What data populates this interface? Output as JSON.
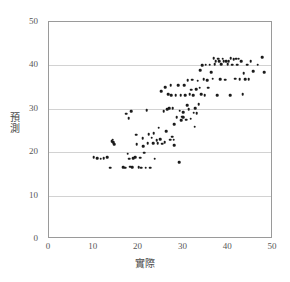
{
  "chart_data": {
    "type": "scatter",
    "title": "",
    "xlabel": "實際",
    "ylabel": "預測",
    "xlim": [
      0,
      50
    ],
    "ylim": [
      0,
      50
    ],
    "xticks": [
      0,
      10,
      20,
      30,
      40,
      50
    ],
    "yticks": [
      0,
      10,
      20,
      30,
      40,
      50
    ],
    "gridlines": {
      "horizontal": [
        10,
        20,
        30,
        40
      ],
      "vertical": []
    },
    "legend": null,
    "marker": {
      "shape": "circle",
      "color": "#1b1b1b",
      "size": 2.6
    },
    "series": [
      {
        "name": "預測 vs 實際",
        "points": [
          [
            10.0,
            18.9
          ],
          [
            10.8,
            18.6
          ],
          [
            11.5,
            18.5
          ],
          [
            12.2,
            18.6
          ],
          [
            13.0,
            18.9
          ],
          [
            13.6,
            16.4
          ],
          [
            14.0,
            22.6
          ],
          [
            14.2,
            22.9
          ],
          [
            14.3,
            22.3
          ],
          [
            14.6,
            21.9
          ],
          [
            16.6,
            16.5
          ],
          [
            17.0,
            16.4
          ],
          [
            17.2,
            28.9
          ],
          [
            17.6,
            19.7
          ],
          [
            17.8,
            27.8
          ],
          [
            17.9,
            18.5
          ],
          [
            18.1,
            16.7
          ],
          [
            18.3,
            29.5
          ],
          [
            18.6,
            16.5
          ],
          [
            18.8,
            18.6
          ],
          [
            19.2,
            18.8
          ],
          [
            19.5,
            24.0
          ],
          [
            19.6,
            21.9
          ],
          [
            20.0,
            16.5
          ],
          [
            20.4,
            18.7
          ],
          [
            20.6,
            16.4
          ],
          [
            20.9,
            23.2
          ],
          [
            21.0,
            21.4
          ],
          [
            21.3,
            19.9
          ],
          [
            21.6,
            16.4
          ],
          [
            21.8,
            29.7
          ],
          [
            22.0,
            22.1
          ],
          [
            22.3,
            24.2
          ],
          [
            22.6,
            16.4
          ],
          [
            22.9,
            23.3
          ],
          [
            23.2,
            22.1
          ],
          [
            23.4,
            24.4
          ],
          [
            23.6,
            18.5
          ],
          [
            24.0,
            22.8
          ],
          [
            24.3,
            22.1
          ],
          [
            24.5,
            25.6
          ],
          [
            24.8,
            23.0
          ],
          [
            25.0,
            34.1
          ],
          [
            25.3,
            22.0
          ],
          [
            25.6,
            29.4
          ],
          [
            25.8,
            22.3
          ],
          [
            26.0,
            35.0
          ],
          [
            26.2,
            24.9
          ],
          [
            26.4,
            29.9
          ],
          [
            26.6,
            33.3
          ],
          [
            26.8,
            30.1
          ],
          [
            27.0,
            22.9
          ],
          [
            27.2,
            35.4
          ],
          [
            27.3,
            33.2
          ],
          [
            27.5,
            23.6
          ],
          [
            27.6,
            30.2
          ],
          [
            27.8,
            22.9
          ],
          [
            27.9,
            21.6
          ],
          [
            28.0,
            26.5
          ],
          [
            28.3,
            33.2
          ],
          [
            28.5,
            28.0
          ],
          [
            28.8,
            35.4
          ],
          [
            29.0,
            17.7
          ],
          [
            29.2,
            29.6
          ],
          [
            29.4,
            33.2
          ],
          [
            29.5,
            27.4
          ],
          [
            29.7,
            28.2
          ],
          [
            29.9,
            29.2
          ],
          [
            30.0,
            28.0
          ],
          [
            30.2,
            35.5
          ],
          [
            30.4,
            33.2
          ],
          [
            30.6,
            27.5
          ],
          [
            30.8,
            30.8
          ],
          [
            31.0,
            36.6
          ],
          [
            31.2,
            29.9
          ],
          [
            31.4,
            33.3
          ],
          [
            31.6,
            27.7
          ],
          [
            31.8,
            34.4
          ],
          [
            32.0,
            36.7
          ],
          [
            32.2,
            33.2
          ],
          [
            32.3,
            29.1
          ],
          [
            32.5,
            25.9
          ],
          [
            32.7,
            30.2
          ],
          [
            32.9,
            34.5
          ],
          [
            33.0,
            29.0
          ],
          [
            33.2,
            36.5
          ],
          [
            33.4,
            31.1
          ],
          [
            33.6,
            34.9
          ],
          [
            33.8,
            38.9
          ],
          [
            34.0,
            33.3
          ],
          [
            34.2,
            40.1
          ],
          [
            34.5,
            36.8
          ],
          [
            34.8,
            33.2
          ],
          [
            35.0,
            40.2
          ],
          [
            35.3,
            36.6
          ],
          [
            35.6,
            34.9
          ],
          [
            35.9,
            40.2
          ],
          [
            36.2,
            38.4
          ],
          [
            36.5,
            36.9
          ],
          [
            36.8,
            41.6
          ],
          [
            37.0,
            40.3
          ],
          [
            37.2,
            40.9
          ],
          [
            37.5,
            33.2
          ],
          [
            37.8,
            41.5
          ],
          [
            38.0,
            40.9
          ],
          [
            38.2,
            36.8
          ],
          [
            38.5,
            40.3
          ],
          [
            38.8,
            41.5
          ],
          [
            39.0,
            41.0
          ],
          [
            39.3,
            36.7
          ],
          [
            39.6,
            40.9
          ],
          [
            39.9,
            40.3
          ],
          [
            40.1,
            41.0
          ],
          [
            40.4,
            33.2
          ],
          [
            40.6,
            41.6
          ],
          [
            40.9,
            40.2
          ],
          [
            41.2,
            41.4
          ],
          [
            41.5,
            36.9
          ],
          [
            41.8,
            41.5
          ],
          [
            42.0,
            40.2
          ],
          [
            42.3,
            41.5
          ],
          [
            42.6,
            36.8
          ],
          [
            42.9,
            40.9
          ],
          [
            43.2,
            33.3
          ],
          [
            43.5,
            38.2
          ],
          [
            43.8,
            36.8
          ],
          [
            44.2,
            40.2
          ],
          [
            44.6,
            36.8
          ],
          [
            45.0,
            40.9
          ],
          [
            45.6,
            38.6
          ],
          [
            46.6,
            40.2
          ],
          [
            47.6,
            41.9
          ],
          [
            48.0,
            38.5
          ]
        ]
      }
    ]
  },
  "caption": {
    "strip_text": ""
  }
}
